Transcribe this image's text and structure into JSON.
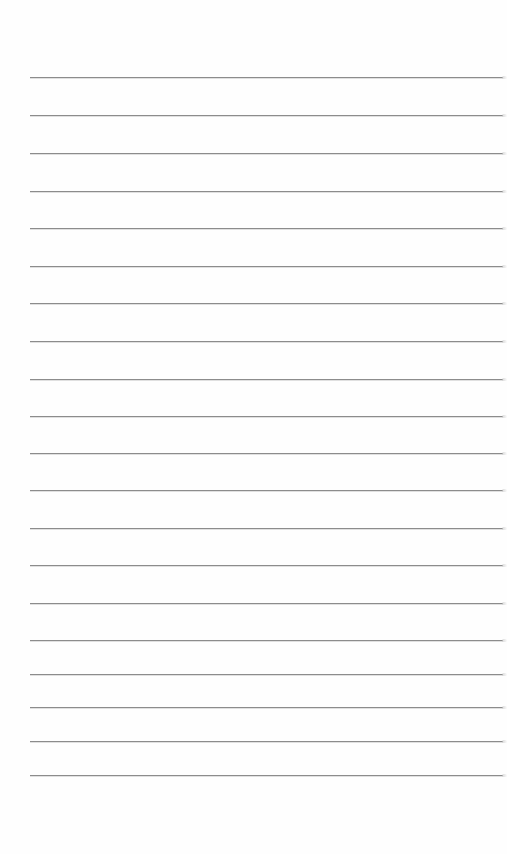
{
  "document": {
    "type": "lined-paper",
    "background_color": "#fefefe",
    "rule_color": "#8c8c8c",
    "rule_left": 30,
    "rule_right": 503,
    "rules": [
      {
        "y": 77
      },
      {
        "y": 115
      },
      {
        "y": 153
      },
      {
        "y": 191
      },
      {
        "y": 228
      },
      {
        "y": 266
      },
      {
        "y": 303
      },
      {
        "y": 341
      },
      {
        "y": 379
      },
      {
        "y": 416
      },
      {
        "y": 453
      },
      {
        "y": 490
      },
      {
        "y": 528
      },
      {
        "y": 565
      },
      {
        "y": 603
      },
      {
        "y": 640
      },
      {
        "y": 674
      },
      {
        "y": 707
      },
      {
        "y": 741
      },
      {
        "y": 775
      }
    ],
    "rule_count": 20,
    "content": ""
  }
}
